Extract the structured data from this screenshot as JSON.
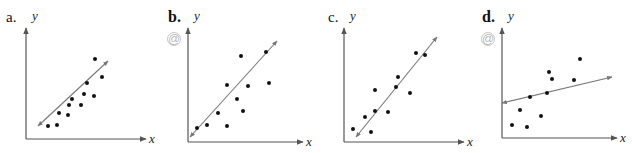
{
  "chart_data": [
    {
      "type": "scatter",
      "panel_label": "a.",
      "xlabel": "x",
      "ylabel": "y",
      "grid": false,
      "has_icon": false,
      "axis": {
        "x0": 26,
        "y0": 139,
        "xend": 146,
        "ytop": 28
      },
      "points": [
        [
          48,
          126
        ],
        [
          57,
          125
        ],
        [
          59,
          113
        ],
        [
          68,
          115
        ],
        [
          69,
          105
        ],
        [
          72,
          99
        ],
        [
          81,
          105
        ],
        [
          84,
          94
        ],
        [
          87,
          83
        ],
        [
          94,
          96
        ],
        [
          102,
          77
        ],
        [
          95,
          59
        ]
      ],
      "fit_line": [
        [
          38,
          126
        ],
        [
          108,
          61
        ]
      ]
    },
    {
      "type": "scatter",
      "panel_label": "b.",
      "xlabel": "x",
      "ylabel": "y",
      "grid": false,
      "has_icon": true,
      "axis": {
        "x0": 188,
        "y0": 142,
        "xend": 303,
        "ytop": 28
      },
      "points": [
        [
          197,
          128
        ],
        [
          207,
          125
        ],
        [
          218,
          113
        ],
        [
          227,
          126
        ],
        [
          227,
          85
        ],
        [
          237,
          99
        ],
        [
          243,
          111
        ],
        [
          248,
          86
        ],
        [
          241,
          56
        ],
        [
          266,
          52
        ],
        [
          269,
          83
        ]
      ],
      "fit_line": [
        [
          190,
          137
        ],
        [
          277,
          41
        ]
      ]
    },
    {
      "type": "scatter",
      "panel_label": "c.",
      "xlabel": "x",
      "ylabel": "y",
      "grid": false,
      "has_icon": false,
      "axis": {
        "x0": 344,
        "y0": 142,
        "xend": 464,
        "ytop": 28
      },
      "points": [
        [
          353,
          129
        ],
        [
          365,
          117
        ],
        [
          371,
          132
        ],
        [
          375,
          111
        ],
        [
          375,
          90
        ],
        [
          388,
          112
        ],
        [
          396,
          87
        ],
        [
          398,
          77
        ],
        [
          410,
          93
        ],
        [
          416,
          53
        ],
        [
          425,
          55
        ]
      ],
      "fit_line": [
        [
          356,
          137
        ],
        [
          437,
          37
        ]
      ]
    },
    {
      "type": "scatter",
      "panel_label": "d.",
      "xlabel": "x",
      "ylabel": "y",
      "grid": false,
      "has_icon": true,
      "axis": {
        "x0": 502,
        "y0": 138,
        "xend": 617,
        "ytop": 28
      },
      "points": [
        [
          512,
          125
        ],
        [
          520,
          110
        ],
        [
          527,
          127
        ],
        [
          530,
          97
        ],
        [
          541,
          116
        ],
        [
          547,
          93
        ],
        [
          549,
          72
        ],
        [
          552,
          79
        ],
        [
          574,
          80
        ],
        [
          580,
          59
        ]
      ],
      "fit_line": [
        [
          502,
          103
        ],
        [
          612,
          77
        ]
      ]
    }
  ],
  "panels": [
    {
      "label": "a.",
      "bold": false,
      "label_x": 6,
      "label_y": 22,
      "ylabel": "y",
      "xlabel": "x"
    },
    {
      "label": "b.",
      "bold": true,
      "label_x": 168,
      "label_y": 22,
      "ylabel": "y",
      "xlabel": "x",
      "icon": "@"
    },
    {
      "label": "c.",
      "bold": false,
      "label_x": 328,
      "label_y": 22,
      "ylabel": "y",
      "xlabel": "x"
    },
    {
      "label": "d.",
      "bold": true,
      "label_x": 482,
      "label_y": 22,
      "ylabel": "y",
      "xlabel": "x",
      "icon": "@"
    }
  ],
  "colors": {
    "axis": "#555555",
    "line": "#777777",
    "point": "#111111",
    "icon": "#b8b8b8"
  }
}
